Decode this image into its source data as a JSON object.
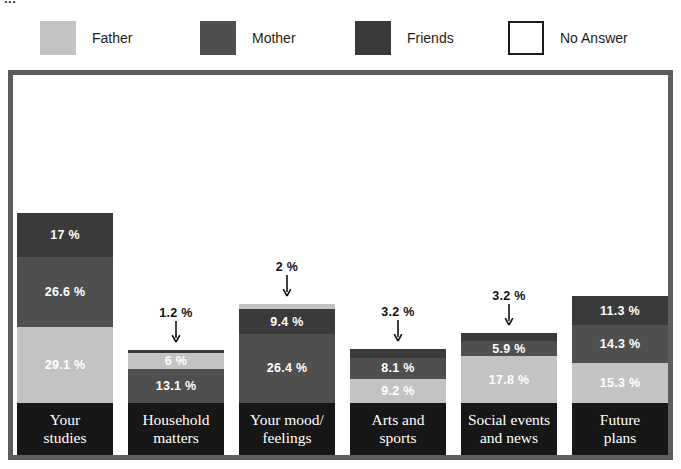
{
  "title_fragment": "...",
  "legend": {
    "items": [
      {
        "label": "Father",
        "color": "#c3c3c3",
        "style": "filled"
      },
      {
        "label": "Mother",
        "color": "#4f4f4f",
        "style": "filled"
      },
      {
        "label": "Friends",
        "color": "#3a3a3a",
        "style": "filled"
      },
      {
        "label": "No Answer",
        "color": "#ffffff",
        "style": "outlined"
      }
    ]
  },
  "colors": {
    "father": "#c3c3c3",
    "mother": "#4f4f4f",
    "friends": "#3a3a3a",
    "no_answer": "#ffffff",
    "frame": "#5d5d5d",
    "category_band": "#171717",
    "text_on_dark": "#ffffff",
    "text_on_light": "#ffffff",
    "callout_text": "#111111"
  },
  "chart_data": {
    "type": "bar",
    "subtype": "stacked-vertical",
    "title": "",
    "xlabel": "",
    "ylabel": "",
    "ylim": [
      0,
      100
    ],
    "grid": false,
    "legend_position": "top",
    "value_suffix": "%",
    "series": [
      {
        "name": "Father",
        "values": [
          29.1,
          6.0,
          2.0,
          9.2,
          17.8,
          15.3
        ]
      },
      {
        "name": "Mother",
        "values": [
          26.6,
          13.1,
          26.4,
          8.1,
          5.9,
          14.3
        ]
      },
      {
        "name": "Friends",
        "values": [
          17.0,
          1.2,
          9.4,
          3.2,
          3.2,
          11.3
        ]
      },
      {
        "name": "No Answer",
        "values": [
          27.3,
          79.7,
          62.2,
          79.5,
          73.1,
          59.1
        ]
      }
    ],
    "categories": [
      "Your\nstudies",
      "Household\nmatters",
      "Your mood/\nfeelings",
      "Arts and\nsports",
      "Social events\nand news",
      "Future\nplans"
    ]
  },
  "columns": [
    {
      "category": "Your\nstudies",
      "segments": [
        {
          "series": "No Answer",
          "value": 27.3,
          "label": "",
          "placement": "none"
        },
        {
          "series": "Friends",
          "value": 17.0,
          "label": "17 %",
          "placement": "inside"
        },
        {
          "series": "Mother",
          "value": 26.6,
          "label": "26.6 %",
          "placement": "inside"
        },
        {
          "series": "Father",
          "value": 29.1,
          "label": "29.1 %",
          "placement": "inside"
        }
      ]
    },
    {
      "category": "Household\nmatters",
      "segments": [
        {
          "series": "No Answer",
          "value": 79.7,
          "label": "",
          "placement": "none"
        },
        {
          "series": "Friends",
          "value": 1.2,
          "label": "1.2 %",
          "placement": "callout"
        },
        {
          "series": "Father",
          "value": 6.0,
          "label": "6 %",
          "placement": "inside"
        },
        {
          "series": "Mother",
          "value": 13.1,
          "label": "13.1 %",
          "placement": "inside"
        }
      ]
    },
    {
      "category": "Your mood/\nfeelings",
      "segments": [
        {
          "series": "No Answer",
          "value": 62.2,
          "label": "",
          "placement": "none"
        },
        {
          "series": "Father",
          "value": 2.0,
          "label": "2 %",
          "placement": "callout"
        },
        {
          "series": "Friends",
          "value": 9.4,
          "label": "9.4 %",
          "placement": "inside"
        },
        {
          "series": "Mother",
          "value": 26.4,
          "label": "26.4 %",
          "placement": "inside"
        }
      ]
    },
    {
      "category": "Arts and\nsports",
      "segments": [
        {
          "series": "No Answer",
          "value": 79.5,
          "label": "",
          "placement": "none"
        },
        {
          "series": "Friends",
          "value": 3.2,
          "label": "3.2 %",
          "placement": "callout"
        },
        {
          "series": "Mother",
          "value": 8.1,
          "label": "8.1 %",
          "placement": "inside"
        },
        {
          "series": "Father",
          "value": 9.2,
          "label": "9.2 %",
          "placement": "inside"
        }
      ]
    },
    {
      "category": "Social events\nand news",
      "segments": [
        {
          "series": "No Answer",
          "value": 73.1,
          "label": "",
          "placement": "none"
        },
        {
          "series": "Friends",
          "value": 3.2,
          "label": "3.2 %",
          "placement": "callout"
        },
        {
          "series": "Mother",
          "value": 5.9,
          "label": "5.9 %",
          "placement": "inside"
        },
        {
          "series": "Father",
          "value": 17.8,
          "label": "17.8 %",
          "placement": "inside"
        }
      ]
    },
    {
      "category": "Future\nplans",
      "segments": [
        {
          "series": "No Answer",
          "value": 59.1,
          "label": "",
          "placement": "none"
        },
        {
          "series": "Friends",
          "value": 11.3,
          "label": "11.3 %",
          "placement": "inside"
        },
        {
          "series": "Mother",
          "value": 14.3,
          "label": "14.3 %",
          "placement": "inside"
        },
        {
          "series": "Father",
          "value": 15.3,
          "label": "15.3 %",
          "placement": "inside"
        }
      ]
    }
  ],
  "layout": {
    "legend_x": [
      40,
      200,
      355,
      508
    ],
    "col_left": [
      4,
      115,
      226,
      337,
      448,
      559
    ],
    "col_width": 96,
    "band_height": 52,
    "plot_inner_height": 380,
    "scale_px_per_pct": 2.62
  }
}
